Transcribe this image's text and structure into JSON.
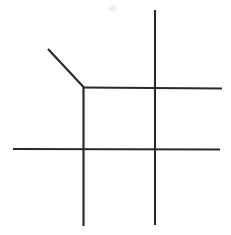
{
  "canvas": {
    "width": 231,
    "height": 235,
    "background_color": "#ffffff",
    "description": "hand-drawn grid figure with diagonal stroke"
  },
  "drawing": {
    "title": "grid-with-diagonal",
    "stroke_color": "#2a2a2e",
    "stroke_width": 2.1,
    "strokes": [
      {
        "name": "diagonal-stroke",
        "type": "line",
        "x1": 48,
        "y1": 49,
        "x2": 83.5,
        "y2": 87,
        "stroke_width": 2.2
      },
      {
        "name": "upper-horizontal-line",
        "type": "line",
        "x1": 83,
        "y1": 87.5,
        "x2": 222,
        "y2": 88.5,
        "stroke_width": 2.1
      },
      {
        "name": "lower-horizontal-line",
        "type": "line",
        "x1": 13,
        "y1": 149,
        "x2": 220,
        "y2": 149.5,
        "stroke_width": 2.1
      },
      {
        "name": "left-vertical-line",
        "type": "line",
        "x1": 83.5,
        "y1": 86.5,
        "x2": 83.5,
        "y2": 226,
        "stroke_width": 2.2
      },
      {
        "name": "right-vertical-line",
        "type": "line",
        "x1": 155,
        "y1": 10,
        "x2": 155,
        "y2": 225,
        "stroke_width": 2.1
      }
    ],
    "junctions": [
      {
        "name": "corner-junction",
        "x": 83,
        "y": 87,
        "kind": "corner-with-diagonal"
      },
      {
        "name": "upper-right-crossing",
        "x": 155,
        "y": 88,
        "kind": "crossing"
      },
      {
        "name": "lower-left-crossing",
        "x": 83,
        "y": 149,
        "kind": "crossing"
      },
      {
        "name": "lower-right-crossing",
        "x": 155,
        "y": 149,
        "kind": "crossing"
      }
    ],
    "artifacts": [
      {
        "name": "scan-speck",
        "x": 112,
        "y": 8,
        "width": 7,
        "height": 5,
        "color": "#efefef"
      }
    ]
  }
}
